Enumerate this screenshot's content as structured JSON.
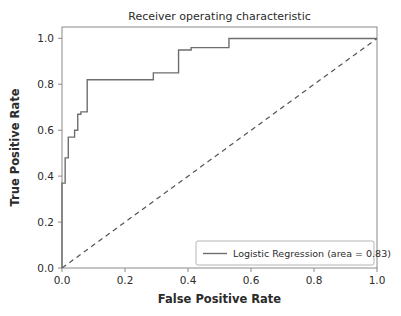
{
  "chart_data": {
    "type": "line",
    "title": "Receiver operating characteristic",
    "xlabel": "False Positive Rate",
    "ylabel": "True Positive Rate",
    "xlim": [
      0.0,
      1.0
    ],
    "ylim": [
      0.0,
      1.05
    ],
    "grid": false,
    "legend_position": "lower right",
    "xticks": [
      "0.0",
      "0.2",
      "0.4",
      "0.6",
      "0.8",
      "1.0"
    ],
    "xtick_values": [
      0.0,
      0.2,
      0.4,
      0.6,
      0.8,
      1.0
    ],
    "yticks": [
      "0.0",
      "0.2",
      "0.4",
      "0.6",
      "0.8",
      "1.0"
    ],
    "ytick_values": [
      0.0,
      0.2,
      0.4,
      0.6,
      0.8,
      1.0
    ],
    "series": [
      {
        "name": "Logistic Regression (area = 0.83)",
        "legend_label": "Logistic Regression (area = 0.83)",
        "color": "#6e6e6e",
        "linestyle": "solid",
        "area": 0.83,
        "x": [
          0.0,
          0.0,
          0.01,
          0.01,
          0.02,
          0.02,
          0.04,
          0.04,
          0.05,
          0.05,
          0.06,
          0.06,
          0.08,
          0.08,
          0.29,
          0.29,
          0.37,
          0.37,
          0.41,
          0.41,
          0.53,
          0.53,
          1.0
        ],
        "y": [
          0.0,
          0.37,
          0.37,
          0.48,
          0.48,
          0.57,
          0.57,
          0.6,
          0.6,
          0.67,
          0.67,
          0.68,
          0.68,
          0.82,
          0.82,
          0.85,
          0.85,
          0.95,
          0.95,
          0.96,
          0.96,
          1.0,
          1.0
        ]
      },
      {
        "name": "chance-reference",
        "legend_label": "",
        "color": "#555555",
        "linestyle": "dashed",
        "x": [
          0.0,
          1.0
        ],
        "y": [
          0.0,
          1.0
        ]
      }
    ]
  },
  "legend": {
    "entries": [
      {
        "label": "Logistic Regression (area = 0.83)",
        "color": "#6e6e6e",
        "linestyle": "solid"
      }
    ]
  }
}
